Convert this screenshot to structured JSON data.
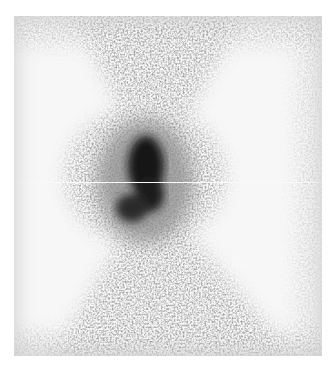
{
  "image": {
    "kind": "grayscale scintigraphy / particle density image",
    "description": "Dark central elongated blob with diffuse X-shaped speckle distribution on light background",
    "colors": {
      "background": "#ffffff",
      "field": "#f4f4f4",
      "blob_core": "#111111",
      "speckle": "#777777"
    },
    "blob": {
      "cx": 145,
      "cy": 175,
      "rx": 22,
      "ry": 45
    },
    "scanline_y": 182
  }
}
